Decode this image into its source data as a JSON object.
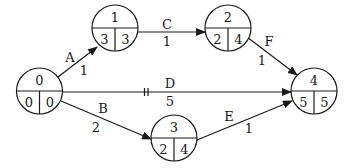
{
  "diagram": {
    "type": "activity-on-arrow network",
    "nodes": [
      {
        "id": "0",
        "es": "0",
        "lf": "0",
        "cx": 39.5,
        "cy": 91
      },
      {
        "id": "1",
        "es": "3",
        "lf": "3",
        "cx": 115,
        "cy": 28
      },
      {
        "id": "2",
        "es": "2",
        "lf": "4",
        "cx": 228,
        "cy": 28
      },
      {
        "id": "3",
        "es": "2",
        "lf": "4",
        "cx": 174,
        "cy": 138
      },
      {
        "id": "4",
        "es": "5",
        "lf": "5",
        "cx": 314,
        "cy": 91
      }
    ],
    "edges": [
      {
        "activity": "A",
        "duration": "1",
        "from": "0",
        "to": "1"
      },
      {
        "activity": "B",
        "duration": "2",
        "from": "0",
        "to": "3"
      },
      {
        "activity": "C",
        "duration": "1",
        "from": "1",
        "to": "2"
      },
      {
        "activity": "D",
        "duration": "5",
        "from": "0",
        "to": "4",
        "marker": "||"
      },
      {
        "activity": "E",
        "duration": "1",
        "from": "3",
        "to": "4"
      },
      {
        "activity": "F",
        "duration": "1",
        "from": "2",
        "to": "4"
      }
    ]
  }
}
